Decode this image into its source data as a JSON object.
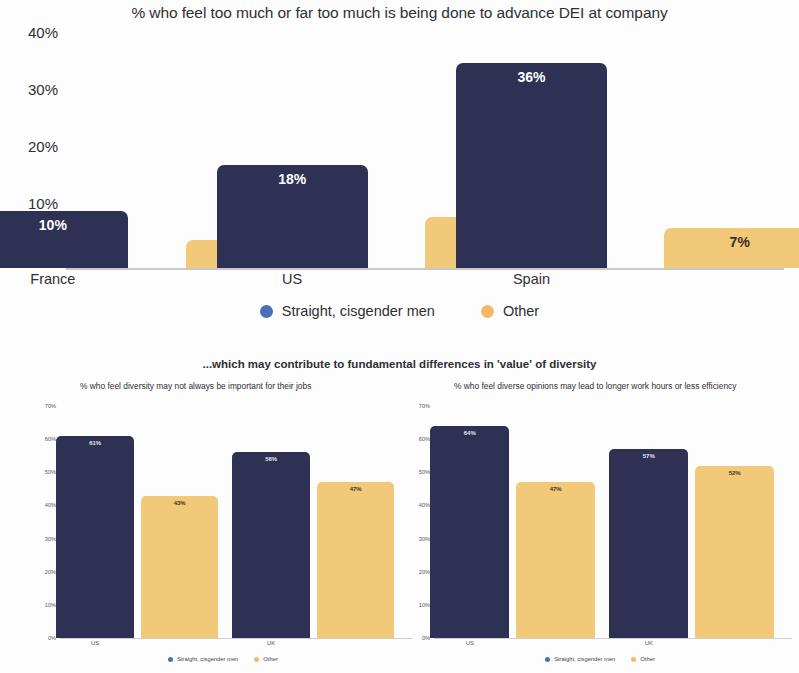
{
  "colors": {
    "navy": "#2e3154",
    "amber": "#f2c879",
    "legend_blue": "#4a6fb5",
    "legend_amber": "#f3b96b",
    "text": "#2f2f33",
    "axis": "#c8c8c8"
  },
  "mid_subtitle": "...which may contribute to fundamental differences in 'value' of diversity",
  "legend": {
    "series_1": "Straight, cisgender men",
    "series_2": "Other",
    "dot_1_icon": "circle-legend-icon",
    "dot_2_icon": "circle-legend-icon"
  },
  "chart_data": [
    {
      "id": "top",
      "type": "bar",
      "title": "% who feel too much or far too much is being done to advance DEI at company",
      "xlabel": "",
      "ylabel": "",
      "categories": [
        "France",
        "US",
        "Spain"
      ],
      "ylim": [
        0,
        40
      ],
      "yticks": [
        "0%",
        "10%",
        "20%",
        "30%",
        "40%"
      ],
      "ytick_values": [
        0,
        10,
        20,
        30,
        40
      ],
      "grid": false,
      "legend_position": "bottom-center",
      "series": [
        {
          "name": "Straight, cisgender men",
          "color": "#2e3154",
          "values": [
            10,
            18,
            36
          ],
          "labels": [
            "10%",
            "18%",
            "36%"
          ]
        },
        {
          "name": "Other",
          "color": "#f2c879",
          "values": [
            5,
            9,
            7
          ],
          "labels": [
            "5%",
            "9%",
            "7%"
          ]
        }
      ]
    },
    {
      "id": "bottom-left",
      "type": "bar",
      "title": "% who feel diversity may not always be important for their jobs",
      "xlabel": "",
      "ylabel": "",
      "categories": [
        "US",
        "UK"
      ],
      "ylim": [
        0,
        70
      ],
      "yticks": [
        "0%",
        "10%",
        "20%",
        "30%",
        "40%",
        "50%",
        "60%",
        "70%"
      ],
      "ytick_values": [
        0,
        10,
        20,
        30,
        40,
        50,
        60,
        70
      ],
      "grid": false,
      "legend_position": "bottom-center",
      "series": [
        {
          "name": "Straight, cisgender men",
          "color": "#2e3154",
          "values": [
            61,
            56
          ],
          "labels": [
            "61%",
            "56%"
          ]
        },
        {
          "name": "Other",
          "color": "#f2c879",
          "values": [
            43,
            47
          ],
          "labels": [
            "43%",
            "47%"
          ]
        }
      ]
    },
    {
      "id": "bottom-right",
      "type": "bar",
      "title": "% who feel diverse opinions may lead to longer work hours or less efficiency",
      "xlabel": "",
      "ylabel": "",
      "categories": [
        "US",
        "UK"
      ],
      "ylim": [
        0,
        70
      ],
      "yticks": [
        "0%",
        "10%",
        "20%",
        "30%",
        "40%",
        "50%",
        "60%",
        "70%"
      ],
      "ytick_values": [
        0,
        10,
        20,
        30,
        40,
        50,
        60,
        70
      ],
      "grid": false,
      "legend_position": "bottom-center",
      "series": [
        {
          "name": "Straight, cisgender men",
          "color": "#2e3154",
          "values": [
            64,
            57
          ],
          "labels": [
            "64%",
            "57%"
          ]
        },
        {
          "name": "Other",
          "color": "#f2c879",
          "values": [
            47,
            52
          ],
          "labels": [
            "47%",
            "52%"
          ]
        }
      ]
    }
  ]
}
